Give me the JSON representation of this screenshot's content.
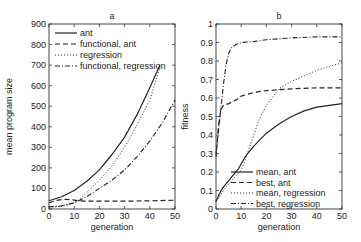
{
  "chart_data": [
    {
      "type": "line",
      "panel": "a",
      "title": "a",
      "xlabel": "generation",
      "ylabel": "mean program size",
      "xlim": [
        0,
        50
      ],
      "ylim": [
        0,
        900
      ],
      "xticks": [
        0,
        10,
        20,
        30,
        40,
        50
      ],
      "yticks": [
        0,
        100,
        200,
        300,
        400,
        500,
        600,
        700,
        800,
        900
      ],
      "grid": false,
      "legend_position": "upper left",
      "series": [
        {
          "name": "ant",
          "style": "solid",
          "x": [
            0,
            5,
            10,
            15,
            20,
            25,
            30,
            35,
            40,
            44
          ],
          "y": [
            40,
            60,
            90,
            135,
            190,
            265,
            350,
            460,
            590,
            700
          ]
        },
        {
          "name": "functional, ant",
          "style": "dashed",
          "x": [
            0,
            3,
            6,
            9,
            12,
            15,
            20,
            30,
            40,
            50
          ],
          "y": [
            30,
            42,
            47,
            45,
            40,
            38,
            38,
            38,
            40,
            43
          ]
        },
        {
          "name": "regression",
          "style": "dotted",
          "x": [
            0,
            5,
            10,
            12,
            15,
            20,
            25,
            30,
            35,
            40,
            44
          ],
          "y": [
            10,
            12,
            30,
            45,
            80,
            140,
            210,
            300,
            410,
            530,
            690
          ]
        },
        {
          "name": "functional, regression",
          "style": "dashdot",
          "x": [
            0,
            5,
            10,
            15,
            20,
            25,
            30,
            35,
            40,
            45,
            50
          ],
          "y": [
            10,
            15,
            30,
            60,
            100,
            140,
            190,
            255,
            330,
            420,
            530
          ]
        }
      ]
    },
    {
      "type": "line",
      "panel": "b",
      "title": "b",
      "xlabel": "generation",
      "ylabel": "fitness",
      "xlim": [
        0,
        50
      ],
      "ylim": [
        0,
        1
      ],
      "xticks": [
        0,
        10,
        20,
        30,
        40,
        50
      ],
      "yticks": [
        0,
        0.1,
        0.2,
        0.3,
        0.4,
        0.5,
        0.6,
        0.7,
        0.8,
        0.9,
        1
      ],
      "grid": false,
      "legend_position": "lower center",
      "series": [
        {
          "name": "mean, ant",
          "style": "solid",
          "x": [
            0,
            1,
            2,
            3,
            9,
            12,
            15,
            20,
            25,
            30,
            35,
            40,
            45,
            50
          ],
          "y": [
            0.04,
            0.07,
            0.1,
            0.12,
            0.22,
            0.29,
            0.34,
            0.41,
            0.46,
            0.5,
            0.53,
            0.55,
            0.56,
            0.57
          ]
        },
        {
          "name": "best, ant",
          "style": "dashed",
          "x": [
            0,
            1,
            2,
            3,
            5,
            8,
            10,
            15,
            20,
            25,
            30,
            40,
            50
          ],
          "y": [
            0.28,
            0.45,
            0.54,
            0.56,
            0.57,
            0.59,
            0.61,
            0.63,
            0.64,
            0.645,
            0.65,
            0.655,
            0.655
          ]
        },
        {
          "name": "mean, regression",
          "style": "dotted",
          "x": [
            0,
            2,
            4,
            10,
            12,
            15,
            17,
            20,
            25,
            30,
            35,
            40,
            45,
            50
          ],
          "y": [
            0.04,
            0.08,
            0.12,
            0.21,
            0.28,
            0.4,
            0.48,
            0.56,
            0.65,
            0.69,
            0.72,
            0.75,
            0.77,
            0.79
          ]
        },
        {
          "name": "best, regression",
          "style": "dashdot",
          "x": [
            0,
            1,
            2,
            3,
            4,
            5,
            6,
            8,
            10,
            15,
            20,
            25,
            30,
            40,
            50
          ],
          "y": [
            0.3,
            0.42,
            0.55,
            0.68,
            0.78,
            0.84,
            0.87,
            0.89,
            0.9,
            0.905,
            0.915,
            0.92,
            0.925,
            0.93,
            0.93
          ]
        }
      ]
    }
  ]
}
